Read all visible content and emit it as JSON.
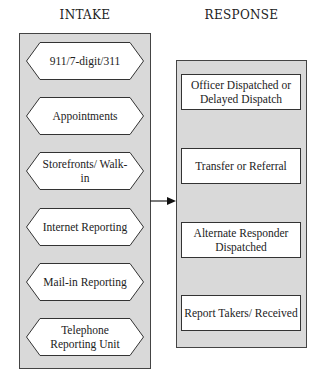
{
  "headings": {
    "intake": "INTAKE",
    "response": "RESPONSE"
  },
  "intake": {
    "items": [
      {
        "label": "911/7-digit/311"
      },
      {
        "label": "Appointments"
      },
      {
        "label": "Storefronts/ Walk-in"
      },
      {
        "label": "Internet Reporting"
      },
      {
        "label": "Mail-in Reporting"
      },
      {
        "label": "Telephone Reporting Unit"
      }
    ]
  },
  "response": {
    "items": [
      {
        "label": "Officer Dispatched or Delayed Dispatch"
      },
      {
        "label": "Transfer or Referral"
      },
      {
        "label": "Alternate Responder Dispatched"
      },
      {
        "label": "Report Takers/ Received"
      }
    ]
  },
  "colors": {
    "panel_fill": "#d9d9d9",
    "border": "#444444",
    "box_fill": "#ffffff"
  }
}
